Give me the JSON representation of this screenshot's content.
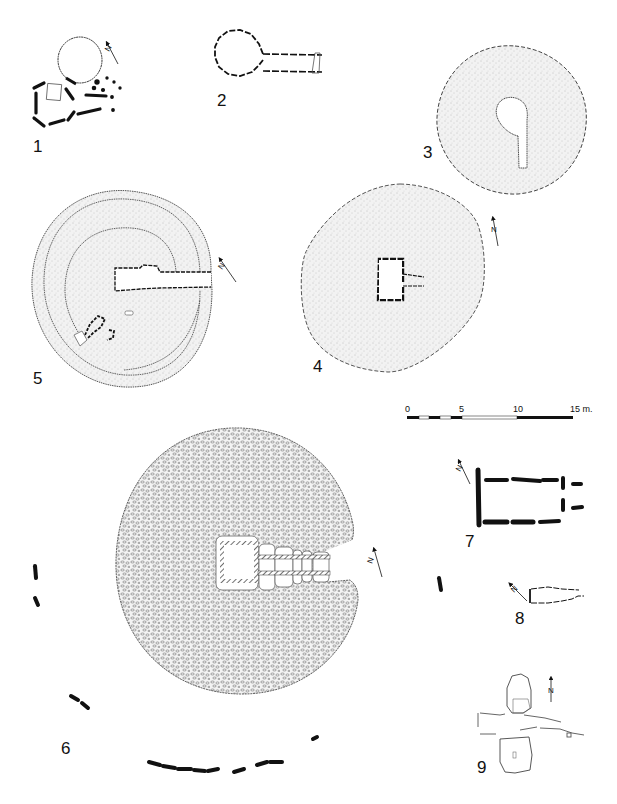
{
  "plate": {
    "type": "archaeological site plans (megalithic tombs / cairns)",
    "background": "#ffffff",
    "ink": "#111111",
    "stipple_fill": "#e9e9e9"
  },
  "figures": [
    {
      "id": "fig-1",
      "label": "1",
      "description": "oval cairn outline with passage and adjacent rectangular stone setting",
      "north_label": "N"
    },
    {
      "id": "fig-2",
      "label": "2",
      "description": "dashed circular chamber with long straight passage ending in a trapezoidal stone"
    },
    {
      "id": "fig-3",
      "label": "3",
      "description": "stippled round cairn with keyhole-shaped chamber and passage"
    },
    {
      "id": "fig-4",
      "label": "4",
      "description": "stippled polygonal cairn with central rectangular chamber and short passage",
      "north_label": "N"
    },
    {
      "id": "fig-5",
      "label": "5",
      "description": "round cairn with concentric kerb rings and long passage to chamber",
      "north_label": "N"
    },
    {
      "id": "fig-6",
      "label": "6",
      "description": "large stone cairn with segmented passage grave and outer stone circle",
      "north_label": "N"
    },
    {
      "id": "fig-7",
      "label": "7",
      "description": "rectangular stone-lined chamber (dolmen) with entrance stones",
      "north_label": "N"
    },
    {
      "id": "fig-8",
      "label": "8",
      "description": "small trapezoidal chamber outline",
      "north_label": "N"
    },
    {
      "id": "fig-9",
      "label": "9",
      "description": "two stone cists flanking a double row of stones",
      "north_label": "N"
    }
  ],
  "scale_bar": {
    "ticks": [
      "0",
      "5",
      "10",
      "15 m."
    ],
    "unit": "m",
    "max": 15
  }
}
